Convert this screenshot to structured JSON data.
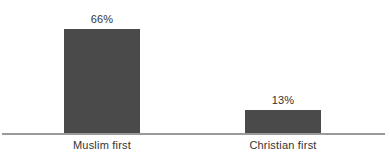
{
  "chart_data": {
    "type": "bar",
    "title": "",
    "subtitle": "",
    "xlabel": "",
    "ylabel": "",
    "categories": [
      "Muslim first",
      "Christian first"
    ],
    "values": [
      66,
      13
    ],
    "value_labels": [
      "66%",
      "13%"
    ],
    "unit": "%",
    "ylim": [
      0,
      66
    ],
    "grid": false,
    "legend": false,
    "legend_position": "none",
    "orientation": "vertical",
    "axis_visible": {
      "x": true,
      "y": false
    },
    "colors": {
      "bar": "#4a4a4a",
      "axis": "#9a9a9a",
      "text": "#333333",
      "background": "#ffffff"
    }
  },
  "bars": [
    {
      "category": "Muslim first",
      "value": 66,
      "label": "66%"
    },
    {
      "category": "Christian first",
      "value": 13,
      "label": "13%"
    }
  ]
}
